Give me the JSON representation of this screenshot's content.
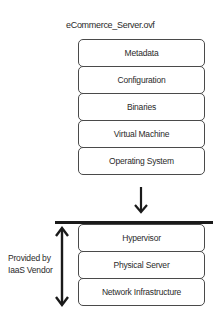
{
  "diagram": {
    "title": "eCommerce_Server.ovf",
    "ovf_layers": [
      {
        "label": "Metadata"
      },
      {
        "label": "Configuration"
      },
      {
        "label": "Binaries"
      },
      {
        "label": "Virtual Machine"
      },
      {
        "label": "Operating System"
      }
    ],
    "vendor_layers": [
      {
        "label": "Hypervisor"
      },
      {
        "label": "Physical Server"
      },
      {
        "label": "Network Infrastructure"
      }
    ],
    "side_label_line1": "Provided by",
    "side_label_line2": "IaaS Vendor",
    "colors": {
      "stroke": "#4a4a4a",
      "arrow": "#1a1a1a",
      "text": "#2a2a2a"
    }
  }
}
